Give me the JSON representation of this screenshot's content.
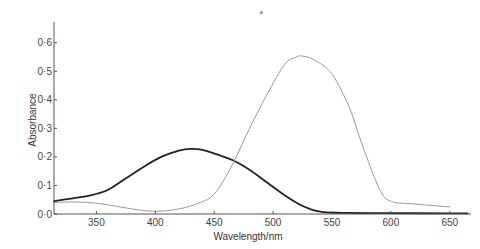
{
  "chart_data": {
    "type": "line",
    "title": "",
    "xlabel": "Wavelength/nm",
    "ylabel": "Absorbance",
    "xlim": [
      314,
      668
    ],
    "ylim": [
      0.0,
      0.67
    ],
    "grid": false,
    "legend": null,
    "x_ticks": [
      350,
      400,
      450,
      500,
      550,
      600,
      650
    ],
    "x_tick_labels": [
      "350",
      "400",
      "450",
      "500",
      "550",
      "600",
      "650"
    ],
    "y_ticks": [
      0.0,
      0.1,
      0.2,
      0.3,
      0.4,
      0.5,
      0.6
    ],
    "y_tick_labels": [
      "0·0",
      "0·1",
      "0·2",
      "0·3",
      "0·4",
      "0·5",
      "0·6"
    ],
    "series": [
      {
        "name": "dark curve (peak ~430 nm)",
        "color": "#222222",
        "stroke_width": 1.8,
        "x": [
          314,
          330,
          345,
          360,
          375,
          390,
          405,
          420,
          430,
          440,
          455,
          466,
          480,
          495,
          510,
          525,
          540,
          560,
          600,
          650,
          665
        ],
        "values": [
          0.045,
          0.055,
          0.065,
          0.085,
          0.125,
          0.165,
          0.2,
          0.222,
          0.228,
          0.225,
          0.205,
          0.188,
          0.155,
          0.11,
          0.065,
          0.028,
          0.008,
          0.004,
          0.003,
          0.002,
          0.002
        ]
      },
      {
        "name": "light curve (peak ~523 nm)",
        "color": "#9a9a9a",
        "stroke_width": 1.0,
        "x": [
          314,
          330,
          350,
          370,
          390,
          405,
          420,
          435,
          450,
          465,
          480,
          495,
          510,
          520,
          525,
          535,
          550,
          565,
          575,
          590,
          600,
          620,
          650
        ],
        "values": [
          0.04,
          0.042,
          0.038,
          0.025,
          0.012,
          0.01,
          0.018,
          0.035,
          0.07,
          0.17,
          0.3,
          0.42,
          0.525,
          0.55,
          0.553,
          0.54,
          0.49,
          0.37,
          0.25,
          0.09,
          0.045,
          0.035,
          0.025
        ]
      }
    ],
    "annotations": [
      {
        "type": "dot",
        "x": 490,
        "y": 0.705,
        "color": "#999999"
      }
    ]
  }
}
